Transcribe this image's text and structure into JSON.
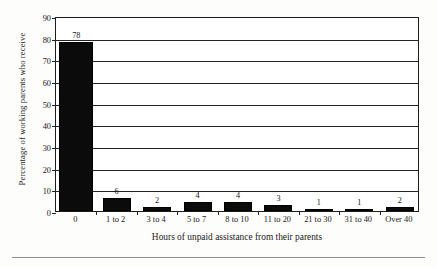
{
  "chart_data": {
    "type": "bar",
    "title": "",
    "subtitle": "",
    "xlabel": "Hours of unpaid assistance from their parents",
    "ylabel": "Percentage of working parents who receive",
    "categories": [
      "0",
      "1 to 2",
      "3 to 4",
      "5 to 7",
      "8 to 10",
      "11 to 20",
      "21 to 30",
      "31 to 40",
      "Over 40"
    ],
    "values": [
      78,
      6,
      2,
      4,
      4,
      3,
      1,
      1,
      2
    ],
    "data_labels": [
      "78",
      "6",
      "2",
      "4",
      "4",
      "3",
      "1",
      "1",
      "2"
    ],
    "ylim": [
      0,
      90
    ],
    "ytick_labels": [
      "0",
      "10",
      "20",
      "30",
      "40",
      "50",
      "60",
      "70",
      "80",
      "90"
    ],
    "ytick_values": [
      0,
      10,
      20,
      30,
      40,
      50,
      60,
      70,
      80,
      90
    ],
    "grid": "horizontal",
    "legend": "none",
    "bar_color": "#0b0b0b",
    "axis_color": "#232323",
    "background_color": "#ffffff"
  }
}
